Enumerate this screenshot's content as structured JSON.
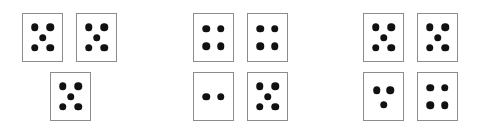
{
  "canvas": {
    "width": 481,
    "height": 132,
    "background": "#ffffff"
  },
  "style": {
    "card_fill": "#ffffff",
    "card_border_color": "#8c8c8c",
    "card_border_width": 1.4,
    "pip_color": "#111111",
    "pip_diameter": 7.5,
    "card_width": 41,
    "card_height": 49
  },
  "chart_data": {
    "type": "table",
    "title": "",
    "groups": [
      {
        "name": "group-1",
        "card_count": 3,
        "total_dots": 15,
        "cards": [
          {
            "name": "card-1-1",
            "dots": 5,
            "pattern": "quincunx",
            "x": 22,
            "y": 13
          },
          {
            "name": "card-1-2",
            "dots": 5,
            "pattern": "quincunx",
            "x": 76,
            "y": 13
          },
          {
            "name": "card-1-3",
            "dots": 5,
            "pattern": "quincunx",
            "x": 50,
            "y": 72
          }
        ]
      },
      {
        "name": "group-2",
        "card_count": 4,
        "total_dots": 15,
        "cards": [
          {
            "name": "card-2-1",
            "dots": 4,
            "pattern": "square",
            "x": 193,
            "y": 13
          },
          {
            "name": "card-2-2",
            "dots": 4,
            "pattern": "square",
            "x": 247,
            "y": 13
          },
          {
            "name": "card-2-3",
            "dots": 2,
            "pattern": "pair-horizontal",
            "x": 193,
            "y": 72
          },
          {
            "name": "card-2-4",
            "dots": 5,
            "pattern": "quincunx",
            "x": 247,
            "y": 72
          }
        ]
      },
      {
        "name": "group-3",
        "card_count": 4,
        "total_dots": 17,
        "cards": [
          {
            "name": "card-3-1",
            "dots": 5,
            "pattern": "quincunx",
            "x": 363,
            "y": 13
          },
          {
            "name": "card-3-2",
            "dots": 5,
            "pattern": "quincunx",
            "x": 417,
            "y": 13
          },
          {
            "name": "card-3-3",
            "dots": 3,
            "pattern": "triangle",
            "x": 363,
            "y": 72
          },
          {
            "name": "card-3-4",
            "dots": 4,
            "pattern": "square",
            "x": 417,
            "y": 72
          }
        ]
      }
    ],
    "patterns": {
      "quincunx": [
        {
          "cx": 0.3,
          "cy": 0.28
        },
        {
          "cx": 0.7,
          "cy": 0.28
        },
        {
          "cx": 0.5,
          "cy": 0.5
        },
        {
          "cx": 0.3,
          "cy": 0.72
        },
        {
          "cx": 0.7,
          "cy": 0.72
        }
      ],
      "square": [
        {
          "cx": 0.32,
          "cy": 0.31
        },
        {
          "cx": 0.68,
          "cy": 0.31
        },
        {
          "cx": 0.32,
          "cy": 0.69
        },
        {
          "cx": 0.68,
          "cy": 0.69
        }
      ],
      "pair-horizontal": [
        {
          "cx": 0.32,
          "cy": 0.5
        },
        {
          "cx": 0.68,
          "cy": 0.5
        }
      ],
      "triangle": [
        {
          "cx": 0.33,
          "cy": 0.37
        },
        {
          "cx": 0.67,
          "cy": 0.37
        },
        {
          "cx": 0.5,
          "cy": 0.68
        }
      ]
    }
  }
}
